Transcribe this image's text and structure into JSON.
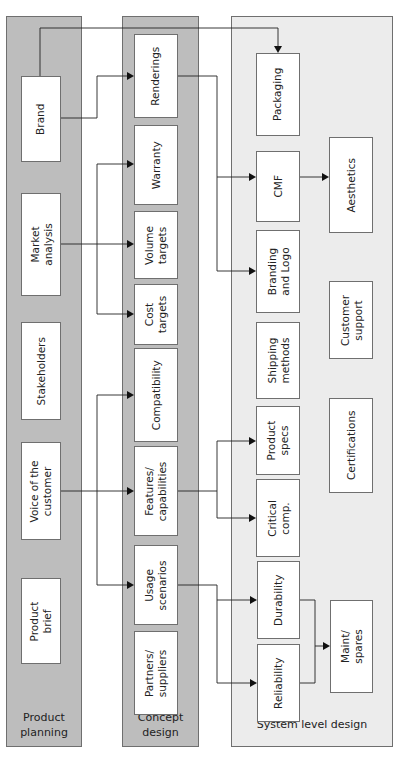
{
  "columns": {
    "product_planning": {
      "label": "Product\nplanning",
      "label_lines": [
        "Product",
        "planning"
      ]
    },
    "concept_design": {
      "label_lines": [
        "Concept",
        "design"
      ]
    },
    "system_level_design": {
      "label_lines": [
        "System level design"
      ]
    }
  },
  "product_planning_boxes": [
    {
      "id": "brand",
      "label": "Brand"
    },
    {
      "id": "market-analysis",
      "label": "Market\nanalysis"
    },
    {
      "id": "stakeholders",
      "label": "Stakeholders"
    },
    {
      "id": "voice-of-the-customer",
      "label": "Voice of the\ncustomer"
    },
    {
      "id": "product-brief",
      "label": "Product\nbrief"
    }
  ],
  "concept_design_boxes": [
    {
      "id": "renderings",
      "label": "Renderings"
    },
    {
      "id": "warranty",
      "label": "Warranty"
    },
    {
      "id": "volume-targets",
      "label": "Volume\ntargets"
    },
    {
      "id": "cost-targets",
      "label": "Cost\ntargets"
    },
    {
      "id": "compatibility",
      "label": "Compatibility"
    },
    {
      "id": "features-capabilities",
      "label": "Features/\ncapabilities"
    },
    {
      "id": "usage-scenarios",
      "label": "Usage\nscenarios"
    },
    {
      "id": "partners-suppliers",
      "label": "Partners/\nsuppliers"
    }
  ],
  "system_level_boxes": [
    {
      "id": "packaging",
      "label": "Packaging"
    },
    {
      "id": "cmf",
      "label": "CMF"
    },
    {
      "id": "aesthetics",
      "label": "Aesthetics"
    },
    {
      "id": "branding-and-logo",
      "label": "Branding\nand Logo"
    },
    {
      "id": "customer-support",
      "label": "Customer\nsupport"
    },
    {
      "id": "shipping-methods",
      "label": "Shipping\nmethods"
    },
    {
      "id": "certifications",
      "label": "Certifications"
    },
    {
      "id": "product-specs",
      "label": "Product\nspecs"
    },
    {
      "id": "critical-comp",
      "label": "Critical\ncomp."
    },
    {
      "id": "durability",
      "label": "Durability"
    },
    {
      "id": "reliability",
      "label": "Reliability"
    },
    {
      "id": "maint-spares",
      "label": "Maint/\nspares"
    }
  ],
  "connections": [
    {
      "from": "Brand",
      "to": "Packaging"
    },
    {
      "from": "Brand",
      "to": "Renderings"
    },
    {
      "from": "Market analysis",
      "to": "Warranty"
    },
    {
      "from": "Market analysis",
      "to": "Volume targets"
    },
    {
      "from": "Market analysis",
      "to": "Cost targets"
    },
    {
      "from": "Voice of the customer",
      "to": "Compatibility"
    },
    {
      "from": "Voice of the customer",
      "to": "Features/capabilities"
    },
    {
      "from": "Voice of the customer",
      "to": "Usage scenarios"
    },
    {
      "from": "Renderings",
      "to": "CMF"
    },
    {
      "from": "Renderings",
      "to": "Branding and Logo"
    },
    {
      "from": "CMF",
      "to": "Aesthetics"
    },
    {
      "from": "Features/capabilities",
      "to": "Product specs"
    },
    {
      "from": "Features/capabilities",
      "to": "Critical comp."
    },
    {
      "from": "Usage scenarios",
      "to": "Durability"
    },
    {
      "from": "Usage scenarios",
      "to": "Reliability"
    },
    {
      "from": "Durability",
      "to": "Maint/spares"
    },
    {
      "from": "Reliability",
      "to": "Maint/spares"
    }
  ],
  "colors": {
    "column_dark": "#bdbdbd",
    "column_light": "#ececec",
    "box": "#ffffff",
    "line": "#222222"
  }
}
